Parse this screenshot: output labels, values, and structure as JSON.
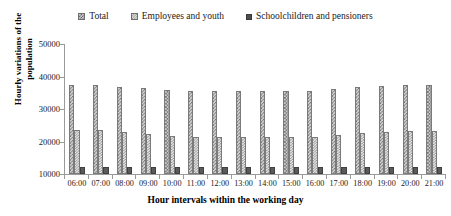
{
  "chart_data": {
    "type": "bar",
    "title": "",
    "xlabel": "Hour intervals within the working day",
    "ylabel": "Hourly variations of the population",
    "ylim": [
      10000,
      50000
    ],
    "yticks": [
      10000,
      20000,
      30000,
      40000,
      50000
    ],
    "ytick_labels": [
      "10000",
      "20000",
      "30000",
      "40000",
      "50000"
    ],
    "grid": false,
    "legend_position": "top-center",
    "categories": [
      "06:00",
      "07:00",
      "08:00",
      "09:00",
      "10:00",
      "11:00",
      "12:00",
      "13:00",
      "14:00",
      "15:00",
      "16:00",
      "17:00",
      "18:00",
      "19:00",
      "20:00",
      "21:00"
    ],
    "series": [
      {
        "name": "Total",
        "values": [
          37300,
          37300,
          36900,
          36500,
          36000,
          35600,
          35600,
          35600,
          35600,
          35600,
          35600,
          36300,
          36800,
          37100,
          37300,
          37400
        ]
      },
      {
        "name": "Employees and youth",
        "values": [
          23400,
          23400,
          22900,
          22400,
          21800,
          21500,
          21500,
          21400,
          21400,
          21300,
          21400,
          22000,
          22500,
          22900,
          23100,
          23300
        ]
      },
      {
        "name": "Schoolchildren and pensioners",
        "values": [
          12200,
          12200,
          12200,
          12100,
          12100,
          12200,
          12200,
          12100,
          12100,
          12100,
          12100,
          12100,
          12200,
          12200,
          12200,
          12200
        ]
      }
    ]
  },
  "legend": {
    "items": [
      {
        "label": "Total",
        "swatch": "crosshatch-pattern-swatch",
        "color": "#c9c9c9"
      },
      {
        "label": "Employees and youth",
        "swatch": "fine-hatch-pattern-swatch",
        "color": "#e2e2e2"
      },
      {
        "label": "Schoolchildren and pensioners",
        "swatch": "solid-square-swatch",
        "color": "#4f4f4f"
      }
    ]
  }
}
